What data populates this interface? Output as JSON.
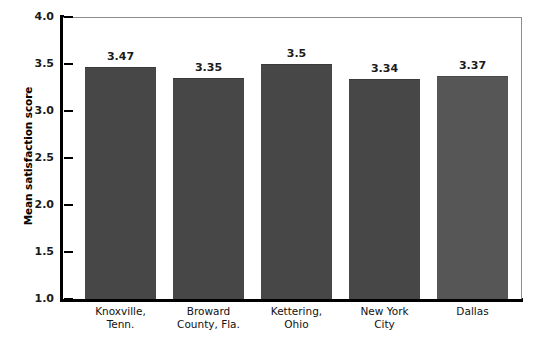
{
  "chart_data": {
    "type": "bar",
    "title": "",
    "xlabel": "",
    "ylabel": "Mean satisfaction score",
    "ylim": [
      1.0,
      4.0
    ],
    "ytick_labels": [
      "4.0",
      "3.5",
      "3.0",
      "2.5",
      "2.0",
      "1.5",
      "1.0"
    ],
    "ytick_values": [
      4.0,
      3.5,
      3.0,
      2.5,
      2.0,
      1.5,
      1.0
    ],
    "grid": false,
    "legend": null,
    "categories": [
      "Knoxville, Tenn.",
      "Broward County, Fla.",
      "Kettering, Ohio",
      "New York City",
      "Dallas"
    ],
    "category_lines": [
      [
        "Knoxville,",
        "Tenn."
      ],
      [
        "Broward",
        "County, Fla."
      ],
      [
        "Kettering,",
        "Ohio"
      ],
      [
        "New York",
        "City"
      ],
      [
        "Dallas",
        ""
      ]
    ],
    "values": [
      3.47,
      3.35,
      3.5,
      3.34,
      3.37
    ],
    "value_labels": [
      "3.47",
      "3.35",
      "3.5",
      "3.34",
      "3.37"
    ],
    "bar_colors": [
      "#474747",
      "#474747",
      "#474747",
      "#474747",
      "#565656"
    ]
  },
  "colors": {
    "bar_fill": "#474747",
    "bar_fill_last": "#565656",
    "axis": "#000000",
    "frame": "#8d8d8d",
    "text": "#111111",
    "background": "#ffffff"
  }
}
